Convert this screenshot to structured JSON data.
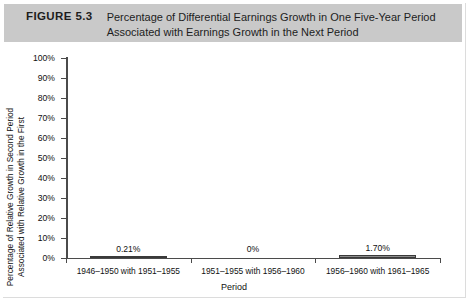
{
  "figure": {
    "number": "FIGURE 5.3",
    "caption_line1": "Percentage of Differential Earnings Growth in One Five-Year Period",
    "caption_line2": "Associated with Earnings Growth in the Next Period"
  },
  "chart_data": {
    "type": "bar",
    "title": "Percentage of Differential Earnings Growth in One Five-Year Period Associated with Earnings Growth in the Next Period",
    "categories": [
      "1946–1950 with 1951–1955",
      "1951–1955 with 1956–1960",
      "1956–1960 with 1961–1965"
    ],
    "values": [
      0.21,
      0,
      1.7
    ],
    "value_labels": [
      "0.21%",
      "0%",
      "1.70%"
    ],
    "xlabel": "Period",
    "ylabel_line1": "Percentage of Relative Growth in Second Period",
    "ylabel_line2": "Associated with Relative Growth in the First",
    "ylim": [
      0,
      100
    ],
    "ytick_labels": [
      "100%",
      "90%",
      "80%",
      "70%",
      "60%",
      "50%",
      "40%",
      "30%",
      "20%",
      "10%",
      "0%"
    ],
    "ytick_values": [
      100,
      90,
      80,
      70,
      60,
      50,
      40,
      30,
      20,
      10,
      0
    ],
    "grid": false,
    "legend": null,
    "bar_fill_color": "#8d8d8d",
    "bar_edge_color": "#3a3a3a",
    "axis_color": "#4b4b4b"
  },
  "style": {
    "header_background": "#c9c9c9",
    "page_background": "#ffffff",
    "text_color": "#1d1d1d"
  }
}
